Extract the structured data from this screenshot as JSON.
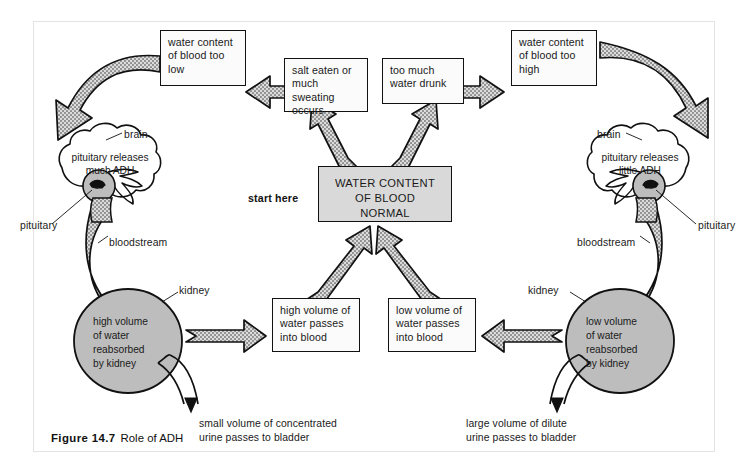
{
  "figure": {
    "number": "Figure 14.7",
    "title": "Role of ADH"
  },
  "start_label": "start here",
  "center_box": {
    "line1": "WATER CONTENT",
    "line2": "OF BLOOD",
    "line3": "NORMAL"
  },
  "boxes": {
    "water_too_low": "water content of blood too low",
    "salt_eaten": "salt eaten or much sweating occurs",
    "too_much_water": "too much water drunk",
    "water_too_high": "water content of blood too high",
    "high_volume_into_blood": "high volume of water passes into blood",
    "low_volume_into_blood": "low volume of water passes into blood"
  },
  "left_side": {
    "brain_label": "brain",
    "pituitary_label": "pituitary",
    "bloodstream_label": "bloodstream",
    "kidney_label": "kidney",
    "brain_text_line1": "pituitary releases",
    "brain_text_line2": "much ADH",
    "kidney_text": [
      "high volume",
      "of water",
      "reabsorbed",
      "by kidney"
    ],
    "urine_text_line1": "small volume of concentrated",
    "urine_text_line2": "urine passes to bladder"
  },
  "right_side": {
    "brain_label": "brain",
    "pituitary_label": "pituitary",
    "bloodstream_label": "bloodstream",
    "kidney_label": "kidney",
    "brain_text_line1": "pituitary releases",
    "brain_text_line2": "little ADH",
    "kidney_text": [
      "low volume",
      "of water",
      "reabsorbed",
      "by kidney"
    ],
    "urine_text_line1": "large volume of dilute",
    "urine_text_line2": "urine passes to bladder"
  },
  "colors": {
    "arrow_fill": "#b5b5b5",
    "arrow_stroke": "#111111",
    "organ_fill": "#bdbdbd",
    "center_box_fill": "#d9d9d9",
    "box_fill": "#fbfbfb",
    "outline": "#111111",
    "page_bg": "#ffffff"
  }
}
